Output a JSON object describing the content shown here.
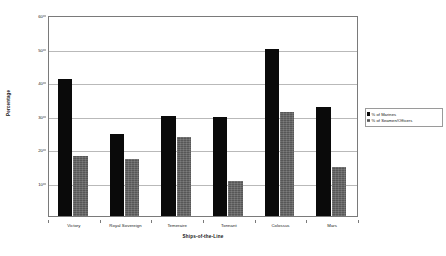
{
  "chart_data": {
    "type": "bar",
    "title": "",
    "xlabel": "Ships-of-the-Line",
    "ylabel": "Percentage",
    "categories": [
      "Victory",
      "Royal Sovereign",
      "Temeraire",
      "Tonnant",
      "Colossus",
      "Mars"
    ],
    "series": [
      {
        "name": "% of Marines",
        "color": "#0a0a0a",
        "values": [
          41,
          24.5,
          30,
          29.5,
          50,
          32.5
        ]
      },
      {
        "name": "% of Seamen/Officers",
        "color": "#575757",
        "values": [
          18,
          17,
          23.5,
          10.5,
          31,
          14.5
        ]
      }
    ],
    "ylim": [
      0,
      60
    ],
    "yticks": [
      60,
      50,
      40,
      30,
      20,
      10
    ],
    "ytick_labels": [
      "60",
      "50",
      "40",
      "30",
      "20",
      "10"
    ],
    "grid": true,
    "grid_axis": "y",
    "legend_position": "right"
  },
  "legend": {
    "entries": [
      {
        "label": "% of Marines"
      },
      {
        "label": "% of Seamen/Officers"
      }
    ]
  }
}
